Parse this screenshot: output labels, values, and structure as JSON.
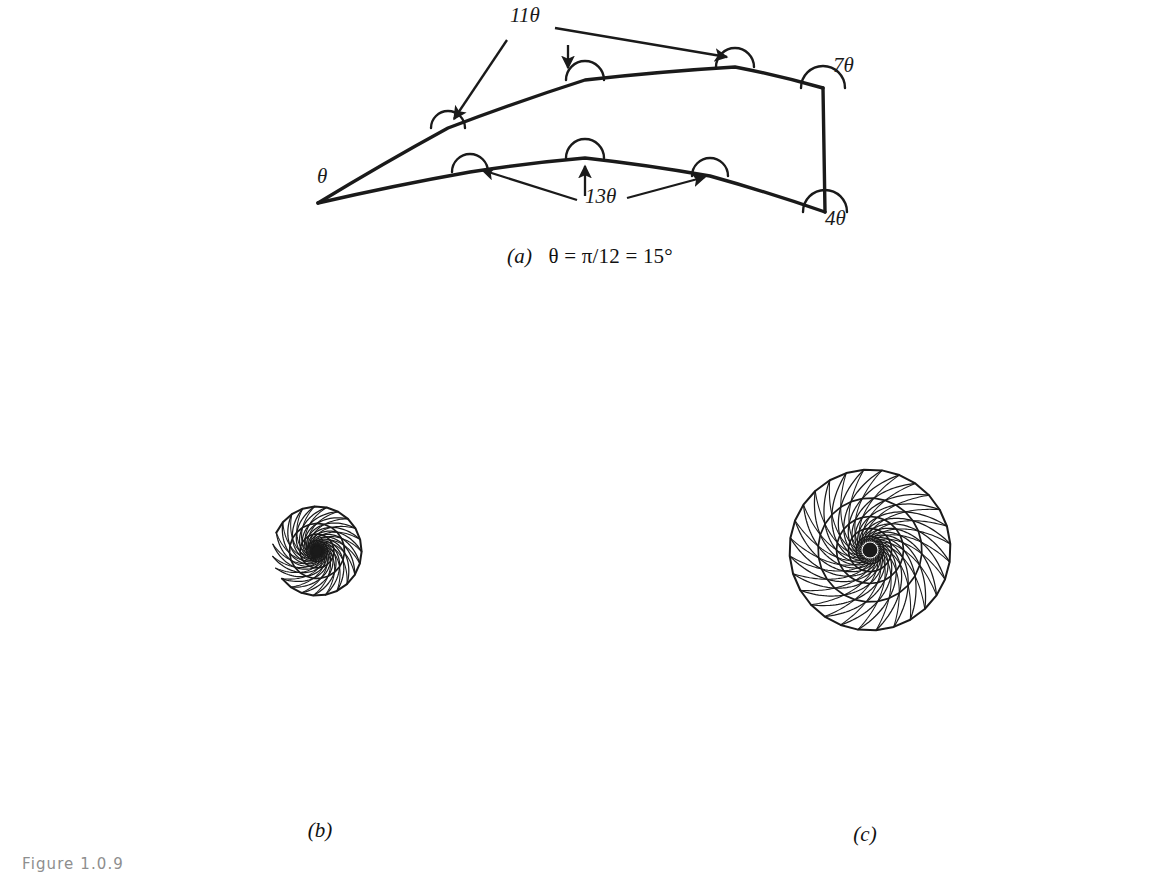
{
  "figure": {
    "caption_number": "Figure 1.0.9",
    "background_color": "#ffffff",
    "ink_color": "#1a1a1a"
  },
  "panel_a": {
    "label": "(a)",
    "caption_text": "θ = π/12 = 15°",
    "caption_full": "(a)  θ = π/12 = 15°",
    "theta_value_radians": "π/12",
    "theta_value_degrees": "15°",
    "vertex_labels": [
      {
        "name": "theta",
        "text": "θ",
        "x": 62,
        "y": 183,
        "angle_multiple": 1
      },
      {
        "name": "eleven-theta",
        "text": "11θ",
        "x": 255,
        "y": 22,
        "angle_multiple": 11
      },
      {
        "name": "thirteen-theta",
        "text": "13θ",
        "x": 330,
        "y": 203,
        "angle_multiple": 13
      },
      {
        "name": "seven-theta",
        "text": "7θ",
        "x": 578,
        "y": 72,
        "angle_multiple": 7
      },
      {
        "name": "four-theta",
        "text": "4θ",
        "x": 570,
        "y": 225,
        "angle_multiple": 4
      }
    ],
    "tile_outline": {
      "apex": [
        63,
        203
      ],
      "upper_chain": [
        [
          63,
          203
        ],
        [
          193,
          128
        ],
        [
          330,
          80
        ],
        [
          480,
          67
        ],
        [
          568,
          88
        ]
      ],
      "lower_chain": [
        [
          63,
          203
        ],
        [
          215,
          172
        ],
        [
          330,
          158
        ],
        [
          455,
          176
        ],
        [
          570,
          212
        ]
      ],
      "right_edge": [
        [
          568,
          88
        ],
        [
          570,
          212
        ]
      ]
    },
    "angle_arcs": [
      {
        "name": "arc-upper-left",
        "cx": 193,
        "cy": 128,
        "r": 17
      },
      {
        "name": "arc-upper-mid",
        "cx": 330,
        "cy": 80,
        "r": 19
      },
      {
        "name": "arc-upper-right",
        "cx": 480,
        "cy": 67,
        "r": 19
      },
      {
        "name": "arc-lower-left",
        "cx": 215,
        "cy": 172,
        "r": 18
      },
      {
        "name": "arc-lower-mid",
        "cx": 330,
        "cy": 158,
        "r": 19
      },
      {
        "name": "arc-lower-right",
        "cx": 455,
        "cy": 176,
        "r": 18
      },
      {
        "name": "arc-corner-top-right",
        "cx": 568,
        "cy": 88,
        "r": 22
      },
      {
        "name": "arc-corner-bottom-right",
        "cx": 570,
        "cy": 212,
        "r": 22
      }
    ],
    "leader_arrows": [
      {
        "name": "arrow-11theta-to-upper-left",
        "from": [
          252,
          40
        ],
        "to": [
          199,
          119
        ]
      },
      {
        "name": "arrow-11theta-to-upper-mid",
        "from": [
          313,
          45
        ],
        "to": [
          313,
          68
        ]
      },
      {
        "name": "arrow-11theta-to-upper-right",
        "from": [
          300,
          28
        ],
        "to": [
          472,
          57
        ]
      },
      {
        "name": "arrow-13theta-to-lower-left",
        "from": [
          322,
          200
        ],
        "to": [
          227,
          170
        ]
      },
      {
        "name": "arrow-13theta-to-lower-mid",
        "from": [
          330,
          196
        ],
        "to": [
          330,
          166
        ]
      },
      {
        "name": "arrow-13theta-to-lower-right",
        "from": [
          372,
          198
        ],
        "to": [
          450,
          177
        ]
      }
    ]
  },
  "panel_b": {
    "label": "(b)",
    "tiling": {
      "type": "spiral-tiling",
      "arms": 23,
      "rings": 5,
      "growth_per_ring": 1.62,
      "twist_per_ring_deg": 44,
      "arm_skew_deg": 16,
      "inner_radius": 4,
      "center": [
        322,
        268
      ],
      "outer_notch": true,
      "notch_start_deg": 150,
      "notch_end_deg": 196
    }
  },
  "panel_c": {
    "label": "(c)",
    "tiling": {
      "type": "spiral-tiling",
      "arms": 28,
      "rings": 5,
      "growth_per_ring": 1.55,
      "twist_per_ring_deg": 30,
      "arm_skew_deg": 22,
      "inner_radius": 9,
      "center": [
        280,
        262
      ],
      "outer_notch": false,
      "ragged_edge": true
    }
  }
}
